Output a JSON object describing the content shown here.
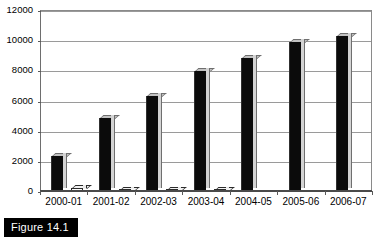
{
  "figure": {
    "caption": "Figure 14.1"
  },
  "chart_data": {
    "type": "bar",
    "title": "",
    "xlabel": "",
    "ylabel": "",
    "ylim": [
      0,
      12000
    ],
    "ytick_step": 2000,
    "ytick_labels": [
      "12000",
      "10000",
      "8000",
      "6000",
      "4000",
      "2000",
      "0"
    ],
    "ytick_values": [
      12000,
      10000,
      8000,
      6000,
      4000,
      2000,
      0
    ],
    "grid": true,
    "legend": "none",
    "categories": [
      "2000-01",
      "2001-02",
      "2002-03",
      "2003-04",
      "2004-05",
      "2005-06",
      "2006-07"
    ],
    "series": [
      {
        "name": "Series 1",
        "style": "black",
        "values": [
          2330,
          4870,
          6330,
          7930,
          8800,
          9900,
          10300
        ]
      },
      {
        "name": "Series 2",
        "style": "white",
        "values": [
          170,
          90,
          80,
          70,
          0,
          0,
          0
        ]
      }
    ]
  }
}
